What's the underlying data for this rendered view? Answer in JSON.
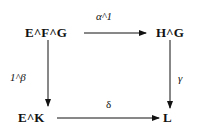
{
  "diagram": {
    "type": "commutative-square",
    "nodes": {
      "top_left": "E^F^G",
      "top_right": "H^G",
      "bottom_left": "E^K",
      "bottom_right": "L"
    },
    "arrows": {
      "top": "α^1",
      "left": "1^β",
      "right": "γ",
      "bottom": "δ"
    }
  }
}
